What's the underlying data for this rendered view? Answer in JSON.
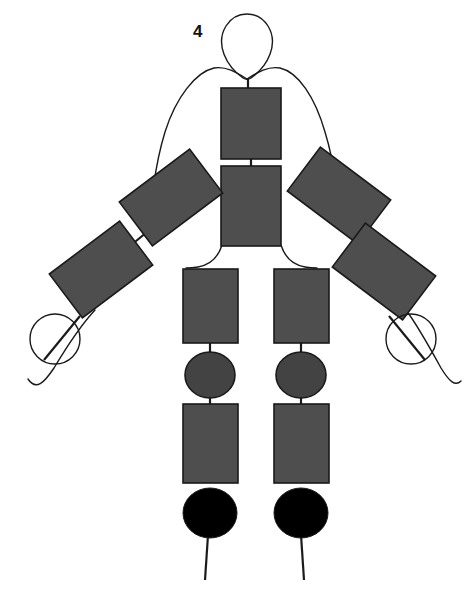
{
  "figure": {
    "label": "4",
    "label_position": {
      "x": 193,
      "y": 23
    },
    "background_color": "#ffffff",
    "outline_color": "#1a1a1a",
    "segment_fill": "#4e4e4e",
    "joint_fill": "#434343",
    "foot_fill": "#000000",
    "stroke_width": 1.4,
    "segment_stroke_width": 1.6
  },
  "contours": {
    "head_loop": "M 243 78 C 226 66 215 44 226 26 C 236 10 258 10 268 26 C 279 44 268 66 251 78 C 248 80 246 80 243 78 Z",
    "neck_left_shoulder": "M 247 79 C 236 72 226 66 214 68 C 196 72 176 97 165 132 C 157 158 155 176 153 190",
    "neck_right_shoulder": "M 247 79 C 258 72 268 66 280 68 C 298 72 315 97 325 132 C 333 158 335 176 337 190",
    "hip_left_thigh": "M 222 245 C 218 258 209 265 198 267 C 192 268 188 268 186 268",
    "hip_right_thigh": "M 281 245 C 285 258 294 265 305 267 C 311 268 315 268 317 268",
    "left_hand_tail": "M 95 310 C 80 326 66 348 54 368 C 44 383 36 391 28 379",
    "right_hand_tail": "M 406 310 C 418 326 430 348 441 368 C 449 381 455 387 461 381"
  },
  "segments": [
    {
      "name": "upper-torso",
      "x": 221,
      "y": 88,
      "w": 60,
      "h": 71,
      "rotation": 0
    },
    {
      "name": "lower-torso",
      "x": 221,
      "y": 166,
      "w": 60,
      "h": 80,
      "rotation": 0
    },
    {
      "name": "left-upper-arm",
      "x": 127,
      "y": 170,
      "w": 88,
      "h": 55,
      "rotation": -37
    },
    {
      "name": "left-forearm",
      "x": 57,
      "y": 242,
      "w": 88,
      "h": 55,
      "rotation": -37
    },
    {
      "name": "right-upper-arm",
      "x": 295,
      "y": 168,
      "w": 88,
      "h": 55,
      "rotation": 37
    },
    {
      "name": "right-forearm",
      "x": 340,
      "y": 244,
      "w": 88,
      "h": 55,
      "rotation": 37
    },
    {
      "name": "left-thigh",
      "x": 183,
      "y": 269,
      "w": 55,
      "h": 74,
      "rotation": 0
    },
    {
      "name": "right-thigh",
      "x": 274,
      "y": 269,
      "w": 55,
      "h": 74,
      "rotation": 0
    },
    {
      "name": "left-shin",
      "x": 183,
      "y": 404,
      "w": 55,
      "h": 79,
      "rotation": 0
    },
    {
      "name": "right-shin",
      "x": 274,
      "y": 404,
      "w": 55,
      "h": 79,
      "rotation": 0
    }
  ],
  "joints": [
    {
      "name": "left-knee",
      "cx": 210,
      "cy": 375,
      "rx": 25,
      "ry": 23,
      "fill": "#434343"
    },
    {
      "name": "right-knee",
      "cx": 301,
      "cy": 375,
      "rx": 25,
      "ry": 23,
      "fill": "#434343"
    }
  ],
  "feet": [
    {
      "name": "left-foot",
      "cx": 210,
      "cy": 513,
      "rx": 27,
      "ry": 25,
      "fill": "#000000"
    },
    {
      "name": "right-foot",
      "cx": 301,
      "cy": 513,
      "rx": 27,
      "ry": 25,
      "fill": "#000000"
    }
  ],
  "hands": [
    {
      "name": "left-hand",
      "cx": 55,
      "cy": 339,
      "r": 25
    },
    {
      "name": "right-hand",
      "cx": 411,
      "cy": 339,
      "r": 25
    }
  ],
  "connectors": [
    {
      "name": "neck-link",
      "x1": 248,
      "y1": 78,
      "x2": 248,
      "y2": 89
    },
    {
      "name": "torso-link",
      "x1": 251,
      "y1": 159,
      "x2": 251,
      "y2": 167
    },
    {
      "name": "left-elbow-link",
      "x1": 147,
      "y1": 232,
      "x2": 130,
      "y2": 246
    },
    {
      "name": "right-elbow-link",
      "x1": 370,
      "y1": 234,
      "x2": 383,
      "y2": 246
    },
    {
      "name": "left-knee-upper-link",
      "x1": 210,
      "y1": 343,
      "x2": 210,
      "y2": 354
    },
    {
      "name": "left-knee-lower-link",
      "x1": 210,
      "y1": 396,
      "x2": 210,
      "y2": 405
    },
    {
      "name": "right-knee-upper-link",
      "x1": 301,
      "y1": 343,
      "x2": 301,
      "y2": 354
    },
    {
      "name": "right-knee-lower-link",
      "x1": 301,
      "y1": 396,
      "x2": 301,
      "y2": 405
    },
    {
      "name": "left-toe-line",
      "x1": 209,
      "y1": 520,
      "x2": 205,
      "y2": 580
    },
    {
      "name": "right-toe-line",
      "x1": 300,
      "y1": 520,
      "x2": 304,
      "y2": 580
    },
    {
      "name": "left-hand-stick",
      "x1": 80,
      "y1": 316,
      "x2": 44,
      "y2": 360
    },
    {
      "name": "right-hand-stick",
      "x1": 389,
      "y1": 316,
      "x2": 425,
      "y2": 360
    }
  ]
}
